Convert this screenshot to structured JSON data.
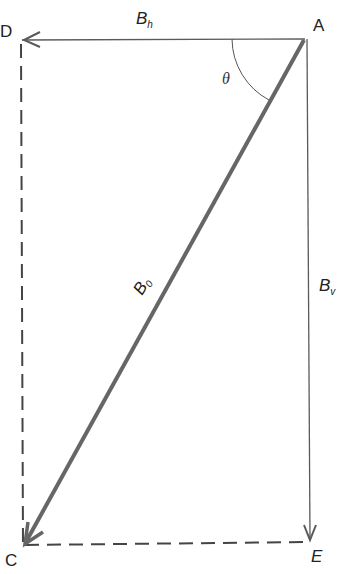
{
  "diagram": {
    "points": {
      "A": "A",
      "C": "C",
      "D": "D",
      "E": "E"
    },
    "vectors": {
      "horizontal": {
        "symbol": "B",
        "subscript": "h"
      },
      "vertical": {
        "symbol": "B",
        "subscript": "v"
      },
      "total": {
        "symbol": "B",
        "subscript": "0"
      }
    },
    "angle": "θ",
    "colors": {
      "line": "#5a5a5a",
      "main_vector": "#666666",
      "text": "#222222"
    }
  }
}
